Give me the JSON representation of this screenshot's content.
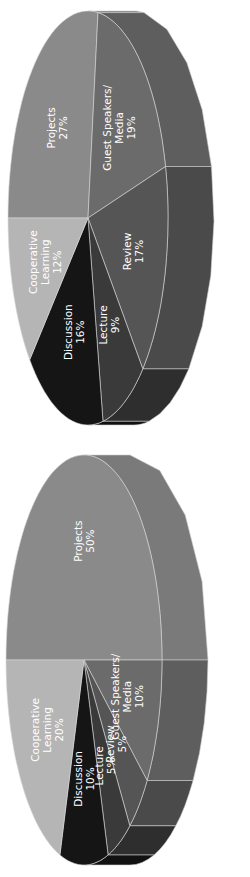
{
  "chart_data": [
    {
      "type": "pie",
      "style": "3d",
      "orientation": "rotated -90deg",
      "title": "",
      "categories": [
        "Projects",
        "Guest Speakers/ Media",
        "Review",
        "Lecture",
        "Discussion",
        "Cooperative Learning"
      ],
      "values": [
        27,
        19,
        17,
        9,
        16,
        12
      ],
      "labels": [
        {
          "lines": [
            "Projects",
            "27%"
          ]
        },
        {
          "lines": [
            "Guest Speakers/",
            "Media",
            "19%"
          ]
        },
        {
          "lines": [
            "Review",
            "17%"
          ]
        },
        {
          "lines": [
            "Lecture",
            "9%"
          ]
        },
        {
          "lines": [
            "Discussion",
            "16%"
          ]
        },
        {
          "lines": [
            "Cooperative",
            "Learning",
            "12%"
          ]
        }
      ],
      "colors": [
        "#8a8a8a",
        "#6b6b6b",
        "#555555",
        "#3a3a3a",
        "#151515",
        "#b5b5b5"
      ],
      "side_colors": [
        "#7a7a7a",
        "#5e5e5e",
        "#4a4a4a",
        "#2e2e2e",
        "#111111",
        "#a0a0a0"
      ],
      "geometry": {
        "u_center": 219,
        "v_center": 88,
        "rx": 207,
        "ry": 80,
        "depth": 46,
        "frame_h": 437
      }
    },
    {
      "type": "pie",
      "style": "3d",
      "orientation": "rotated -90deg",
      "title": "",
      "categories": [
        "Projects",
        "Guest Speakers/ Media",
        "Review",
        "Lecture",
        "Discussion",
        "Cooperative Learning"
      ],
      "values": [
        50,
        10,
        5,
        5,
        10,
        20
      ],
      "labels": [
        {
          "lines": [
            "Projects",
            "50%"
          ]
        },
        {
          "lines": [
            "Guest Speakers/",
            "Media",
            "10%"
          ]
        },
        {
          "lines": [
            "Review",
            "5%"
          ]
        },
        {
          "lines": [
            "Lecture",
            "5%"
          ]
        },
        {
          "lines": [
            "Discussion",
            "10%"
          ]
        },
        {
          "lines": [
            "Cooperative",
            "Learning",
            "20%"
          ]
        }
      ],
      "colors": [
        "#8a8a8a",
        "#6b6b6b",
        "#555555",
        "#3a3a3a",
        "#151515",
        "#b5b5b5"
      ],
      "side_colors": [
        "#7a7a7a",
        "#5e5e5e",
        "#4a4a4a",
        "#2e2e2e",
        "#111111",
        "#a0a0a0"
      ],
      "geometry": {
        "u_center": 217,
        "v_center": 84,
        "rx": 205,
        "ry": 78,
        "depth": 46,
        "frame_h": 440
      }
    }
  ]
}
